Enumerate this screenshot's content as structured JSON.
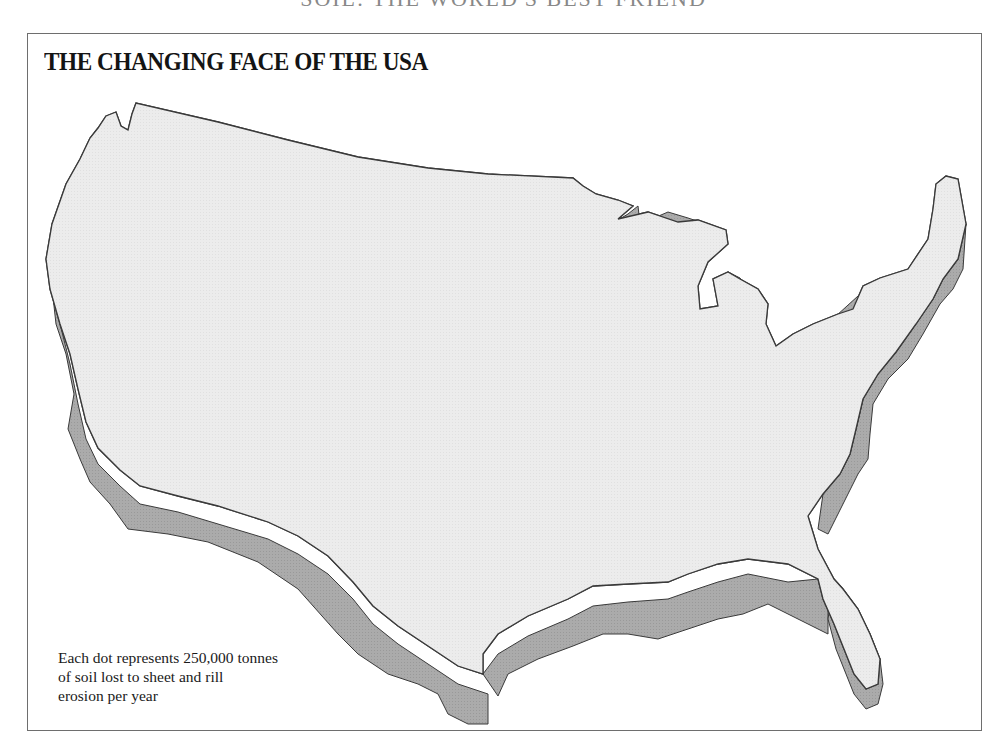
{
  "page": {
    "running_head": "SOIL: THE WORLD'S BEST FRIEND"
  },
  "figure": {
    "title": "THE CHANGING FACE OF THE USA",
    "legend": {
      "line1": "Each dot represents 250,000 tonnes",
      "line2": "of soil lost to sheet and rill",
      "line3": "erosion per year"
    },
    "dot_value_tonnes": 250000,
    "measure": "soil lost to sheet and rill erosion per year",
    "colors": {
      "land": "#ededed",
      "extrusion": "#a9a9a9",
      "dots": "#111111",
      "state_borders": "#ffffff",
      "outline": "#3a3a3a"
    },
    "regions_by_dot_density": [
      {
        "region": "Corn Belt (Iowa, Illinois, Missouri)",
        "density": "very high"
      },
      {
        "region": "Great Plains (Nebraska, Kansas, Dakotas)",
        "density": "high"
      },
      {
        "region": "Mississippi Delta / Lower Mississippi",
        "density": "high"
      },
      {
        "region": "Ohio Valley / Indiana / Ohio",
        "density": "medium"
      },
      {
        "region": "Southeast Piedmont (Carolinas, Georgia)",
        "density": "medium"
      },
      {
        "region": "Texas",
        "density": "medium"
      },
      {
        "region": "Northeast / Mid-Atlantic",
        "density": "medium-low"
      },
      {
        "region": "Palouse (eastern Washington)",
        "density": "low"
      },
      {
        "region": "Mountain West",
        "density": "very low"
      },
      {
        "region": "California coast",
        "density": "very low"
      },
      {
        "region": "Maine",
        "density": "very low"
      },
      {
        "region": "Florida",
        "density": "very low"
      }
    ]
  }
}
